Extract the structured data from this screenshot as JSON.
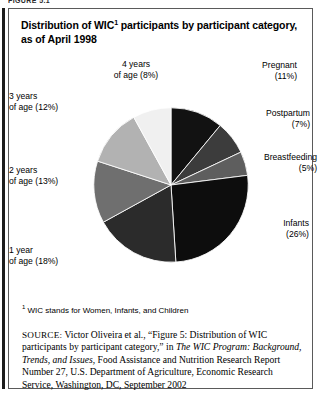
{
  "figure_tag": "FIGURE 5.1",
  "title": {
    "before_sup": "Distribution of WIC",
    "sup": "1",
    "after_sup": " participants by participant category, as of April 1998"
  },
  "footnote": {
    "marker": "1",
    "text": " WIC stands for Women, Infants, and Children"
  },
  "source": {
    "kicker": "SOURCE:",
    "part1": " Victor Oliveira et al., “Figure 5: Distribution of WIC participants by participant category,” in ",
    "italic1": "The WIC Program: Background, Trends, and Issues",
    "part2": ", Food Assistance and Nutrition Research Report Number 27, U.S. Department of Agriculture, Economic Research Service, Washington, DC, September 2002"
  },
  "chart_data": {
    "type": "pie",
    "xlabel": "",
    "ylabel": "",
    "units": "percent",
    "total": 100,
    "start_angle_deg": 0,
    "direction": "clockwise",
    "legend_position": "outside-labels",
    "grid": false,
    "categories": [
      "Pregnant",
      "Postpartum",
      "Breastfeeding",
      "Infants",
      "1 year of age",
      "2 years of age",
      "3 years of age",
      "4 years of age"
    ],
    "values": [
      11,
      7,
      5,
      26,
      18,
      13,
      12,
      8
    ],
    "colors": [
      "#121212",
      "#3c3c3c",
      "#5e5e5e",
      "#0d0d0d",
      "#2b2b2b",
      "#6f6f6f",
      "#b2b2b2",
      "#f0f0f0"
    ],
    "slices": [
      {
        "name": "Pregnant",
        "value": 11,
        "label_line1": "Pregnant",
        "label_line2": "(11%)",
        "color": "#121212"
      },
      {
        "name": "Postpartum",
        "value": 7,
        "label_line1": "Postpartum",
        "label_line2": "(7%)",
        "color": "#3c3c3c"
      },
      {
        "name": "Breastfeeding",
        "value": 5,
        "label_line1": "Breastfeeding",
        "label_line2": "(5%)",
        "color": "#5e5e5e"
      },
      {
        "name": "Infants",
        "value": 26,
        "label_line1": "Infants",
        "label_line2": "(26%)",
        "color": "#0d0d0d"
      },
      {
        "name": "1 year of age",
        "value": 18,
        "label_line1": "1 year",
        "label_line2": "of age (18%)",
        "color": "#2b2b2b"
      },
      {
        "name": "2 years of age",
        "value": 13,
        "label_line1": "2 years",
        "label_line2": "of age (13%)",
        "color": "#6f6f6f"
      },
      {
        "name": "3 years of age",
        "value": 12,
        "label_line1": "3 years",
        "label_line2": "of age (12%)",
        "color": "#b2b2b2"
      },
      {
        "name": "4 years of age",
        "value": 8,
        "label_line1": "4 years",
        "label_line2": "of age (8%)",
        "color": "#f0f0f0"
      }
    ]
  }
}
